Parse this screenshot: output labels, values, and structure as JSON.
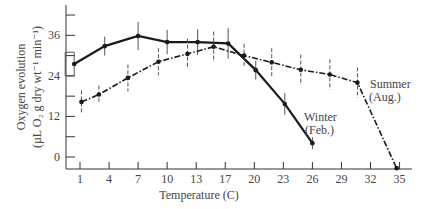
{
  "chart_data": {
    "type": "line",
    "title": "",
    "xlabel": "Temperature (C)",
    "ylabel_line1": "Oxygen evolution",
    "ylabel_line2": "(µL O₂ g dry wt⁻¹ min⁻¹)",
    "x_ticks": [
      "1",
      "4",
      "7",
      "10",
      "13",
      "17",
      "20",
      "23",
      "26",
      "29",
      "32",
      "35"
    ],
    "y_ticks": [
      0,
      12,
      24,
      36
    ],
    "ylim": [
      -4,
      44
    ],
    "grid": false,
    "legend_position": "inline labels",
    "series": [
      {
        "name": "Winter (Feb.)",
        "label_line1": "Winter",
        "label_line2": "(Feb.)",
        "style": "solid",
        "points": [
          {
            "xi": -0.2,
            "x": 1,
            "y": 27.5,
            "err": 3.5
          },
          {
            "xi": 0.85,
            "x": 4,
            "y": 32.8,
            "err": 2.8
          },
          {
            "xi": 2.0,
            "x": 7,
            "y": 35.8,
            "err": 4.2
          },
          {
            "xi": 3.0,
            "x": 10,
            "y": 34.0,
            "err": 3.6
          },
          {
            "xi": 4.05,
            "x": 13,
            "y": 34.0,
            "err": 3.8
          },
          {
            "xi": 5.1,
            "x": 17,
            "y": 33.6,
            "err": 4.5
          },
          {
            "xi": 6.05,
            "x": 20,
            "y": 25.7,
            "err": 2.8
          },
          {
            "xi": 7.05,
            "x": 23,
            "y": 15.7,
            "err": 3.2
          },
          {
            "xi": 8.0,
            "x": 26,
            "y": 4.1,
            "err": 1.8
          }
        ]
      },
      {
        "name": "Summer (Aug.)",
        "label_line1": "Summer",
        "label_line2": "(Aug.)",
        "style": "dash-dot",
        "points": [
          {
            "xi": 0.05,
            "x": 1,
            "y": 16.3,
            "err": 3.4
          },
          {
            "xi": 0.65,
            "x": 3,
            "y": 18.5,
            "err": 2.6
          },
          {
            "xi": 1.65,
            "x": 6,
            "y": 23.4,
            "err": 4.0
          },
          {
            "xi": 2.7,
            "x": 9,
            "y": 28.2,
            "err": 4.0
          },
          {
            "xi": 3.7,
            "x": 12,
            "y": 30.5,
            "err": 4.5
          },
          {
            "xi": 4.6,
            "x": 15,
            "y": 32.6,
            "err": 4.5
          },
          {
            "xi": 5.65,
            "x": 19,
            "y": 30.0,
            "err": 3.5
          },
          {
            "xi": 6.6,
            "x": 22,
            "y": 28.0,
            "err": 4.2
          },
          {
            "xi": 7.6,
            "x": 25,
            "y": 25.8,
            "err": 4.5
          },
          {
            "xi": 8.6,
            "x": 28,
            "y": 24.4,
            "err": 4.5
          },
          {
            "xi": 9.55,
            "x": 31,
            "y": 22.0,
            "err": 4.5
          },
          {
            "xi": 10.9,
            "x": 35,
            "y": -3.3,
            "err": 0
          }
        ]
      }
    ]
  },
  "colors": {
    "line": "#1a1a1a",
    "axis": "#333333",
    "errbar": "#555555",
    "text": "#444444"
  }
}
